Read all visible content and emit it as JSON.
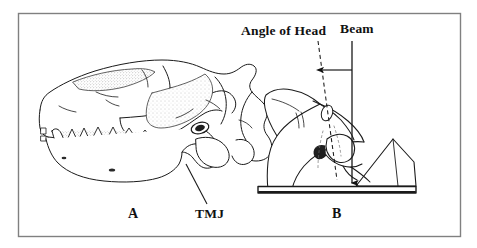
{
  "figure": {
    "caption_labels": {
      "panel_a": "A",
      "panel_b": "B",
      "tmj": "TMJ",
      "angle_of_head": "Angle of Head",
      "beam": "Beam"
    },
    "panels": [
      {
        "id": "A",
        "label": "A",
        "subject": "feline-skull-lateral-view",
        "annotations": [
          {
            "name": "tmj",
            "label": "TMJ",
            "description": "temporomandibular joint indicated by leader line",
            "leader_from": [
              186,
              164
            ],
            "leader_to": [
              207,
              204
            ]
          }
        ]
      },
      {
        "id": "B",
        "label": "B",
        "subject": "feline-head-positioned-on-wedge-with-x-ray-beam",
        "annotations": [
          {
            "name": "angle-of-head",
            "label": "Angle of Head",
            "line_style": "dashed",
            "description": "dashed line along long axis of head"
          },
          {
            "name": "beam",
            "label": "Beam",
            "line_style": "solid-with-arrowhead",
            "description": "vertical primary x-ray beam ending in arrowhead at cassette"
          },
          {
            "name": "angle-span-arrow",
            "label": "",
            "description": "double headed arrow spanning the angle between head axis and beam"
          }
        ],
        "props": [
          {
            "name": "cassette-plate",
            "label": ""
          },
          {
            "name": "foam-wedge",
            "label": ""
          }
        ]
      }
    ],
    "colors": {
      "ink": "#1a1a1a",
      "border": "#808080",
      "background": "#ffffff",
      "stipple": "#9a9a9a"
    },
    "border": {
      "x": 18,
      "y": 13,
      "width": 443,
      "height": 224
    }
  }
}
